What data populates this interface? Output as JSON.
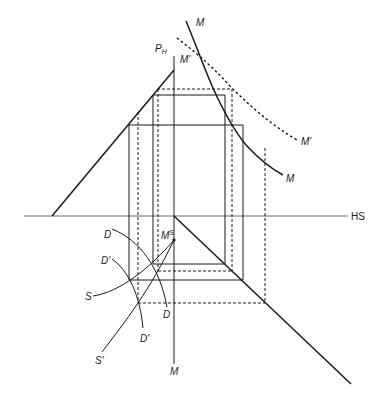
{
  "diagram": {
    "type": "orthographic-projection-construction",
    "labels": {
      "M_top": "M",
      "P_H": "P",
      "P_H_sub": "H",
      "M_prime_top": "M'",
      "M_prime_right": "M'",
      "M_right": "M",
      "HS": "HS",
      "D_upper": "D",
      "M_S": "M",
      "M_S_sup": "S",
      "D_prime_upper": "D'",
      "S": "S",
      "D_lower": "D",
      "D_prime_lower": "D'",
      "S_prime": "S'",
      "M_bottom": "M"
    },
    "lines": {
      "horizon_HS": {
        "x1": 24,
        "y1": 216,
        "x2": 348,
        "y2": 216
      },
      "picture_plane_vertical": {
        "x1": 174,
        "y1": 56,
        "x2": 174,
        "y2": 364
      },
      "left_diagonal": {
        "x1": 52,
        "y1": 216,
        "x2": 174,
        "y2": 70
      },
      "right_diagonal": {
        "x1": 174,
        "y1": 216,
        "x2": 351,
        "y2": 384
      }
    },
    "colors": {
      "ink": "#1a1a1a",
      "background": "#ffffff"
    }
  }
}
